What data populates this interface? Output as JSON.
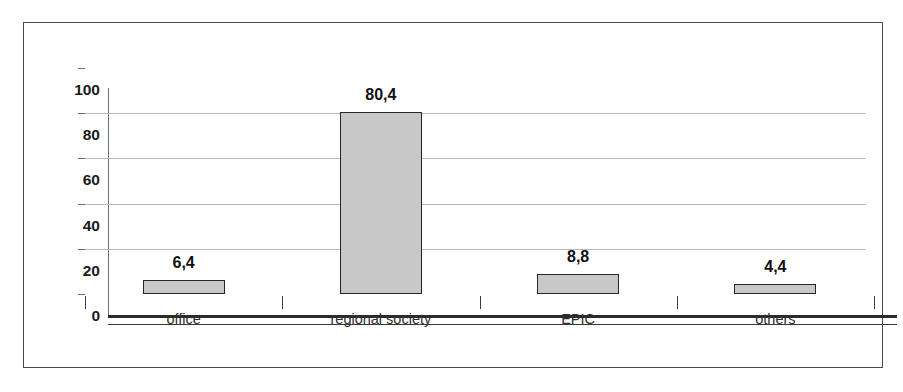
{
  "chart_data": {
    "type": "bar",
    "title": "",
    "subtitle": "",
    "xlabel": "",
    "ylabel": "",
    "categories": [
      "office",
      "regional society",
      "EPIC",
      "others"
    ],
    "values": [
      6.4,
      80.4,
      8.8,
      4.4
    ],
    "value_labels": [
      "6,4",
      "80,4",
      "8,8",
      "4,4"
    ],
    "ylim": [
      0,
      100
    ],
    "y_ticks": [
      0,
      20,
      40,
      60,
      80,
      100
    ],
    "y_tick_labels": [
      "0",
      "20",
      "40",
      "60",
      "80",
      "100"
    ],
    "grid": true,
    "grid_axis": "y",
    "legend": false,
    "legend_position": "none",
    "decimal_separator": ",",
    "series": [
      {
        "name": "",
        "values": [
          6.4,
          80.4,
          8.8,
          4.4
        ]
      }
    ],
    "colors": {
      "bar_fill": "#c8c8c8",
      "bar_border": "#262626",
      "gridline": "#b9b9b9",
      "axis": "#2b2b2b",
      "text": "#121212",
      "frame_border": "#4a4a4a",
      "background": "#ffffff"
    }
  }
}
